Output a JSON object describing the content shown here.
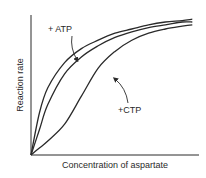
{
  "chart_data": {
    "type": "line",
    "title": "",
    "xlabel": "Concentration of aspartate",
    "ylabel": "Reaction rate",
    "xlim": [
      0,
      1
    ],
    "ylim": [
      0,
      1
    ],
    "grid": false,
    "legend": "none",
    "series": [
      {
        "name": "+ ATP",
        "shape": "hyperbolic",
        "x": [
          0,
          0.05,
          0.1,
          0.2,
          0.3,
          0.4,
          0.5,
          0.6,
          0.7,
          0.8,
          0.9,
          0.96
        ],
        "values": [
          0,
          0.3,
          0.48,
          0.66,
          0.76,
          0.82,
          0.87,
          0.9,
          0.93,
          0.95,
          0.96,
          0.97
        ]
      },
      {
        "name": "no effector",
        "shape": "sigmoidal",
        "x": [
          0,
          0.05,
          0.1,
          0.2,
          0.3,
          0.4,
          0.5,
          0.6,
          0.7,
          0.8,
          0.9,
          0.96
        ],
        "values": [
          0,
          0.18,
          0.36,
          0.58,
          0.7,
          0.78,
          0.84,
          0.88,
          0.91,
          0.93,
          0.95,
          0.95
        ]
      },
      {
        "name": "+ CTP",
        "shape": "sigmoidal",
        "x": [
          0,
          0.05,
          0.1,
          0.2,
          0.3,
          0.4,
          0.5,
          0.6,
          0.7,
          0.8,
          0.9,
          0.96
        ],
        "values": [
          0,
          0.05,
          0.1,
          0.22,
          0.42,
          0.62,
          0.74,
          0.82,
          0.87,
          0.9,
          0.92,
          0.93
        ]
      }
    ],
    "annotations": [
      {
        "text": "+ ATP",
        "points_to": "+ ATP"
      },
      {
        "text": "+CTP",
        "points_to": "+ CTP"
      }
    ]
  }
}
